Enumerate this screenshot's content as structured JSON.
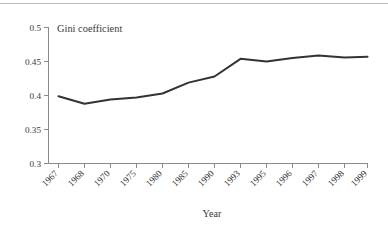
{
  "chart_data": {
    "type": "line",
    "title": "Gini coefficient",
    "subtitle": "",
    "xlabel": "Year",
    "ylabel": "",
    "categories": [
      "1967",
      "1968",
      "1970",
      "1975",
      "1980",
      "1985",
      "1990",
      "1993",
      "1995",
      "1996",
      "1997",
      "1998",
      "1999"
    ],
    "values": [
      0.399,
      0.388,
      0.394,
      0.397,
      0.403,
      0.419,
      0.428,
      0.454,
      0.45,
      0.455,
      0.459,
      0.456,
      0.457
    ],
    "series": [
      {
        "name": "Gini coefficient",
        "values": [
          0.399,
          0.388,
          0.394,
          0.397,
          0.403,
          0.419,
          0.428,
          0.454,
          0.45,
          0.455,
          0.459,
          0.456,
          0.457
        ]
      }
    ],
    "ylim": [
      0.3,
      0.5
    ],
    "yticks": [
      0.3,
      0.35,
      0.4,
      0.45,
      0.5
    ],
    "ytick_labels": [
      "0.3",
      "0.35",
      "0.4",
      "0.45",
      "0.5"
    ],
    "grid": false,
    "legend": false,
    "legend_position": "none",
    "xtick_rotation": 45,
    "line_color": "#333333",
    "axis_color": "#808080",
    "background_color": "#ffffff"
  },
  "axis": {
    "y_labels": [
      "0.5",
      "0.45",
      "0.4",
      "0.35",
      "0.3"
    ],
    "x_labels": [
      "1967",
      "1968",
      "1970",
      "1975",
      "1980",
      "1985",
      "1990",
      "1993",
      "1995",
      "1996",
      "1997",
      "1998",
      "1999"
    ],
    "x_title": "Year"
  },
  "title": {
    "text": "Gini coefficient"
  }
}
